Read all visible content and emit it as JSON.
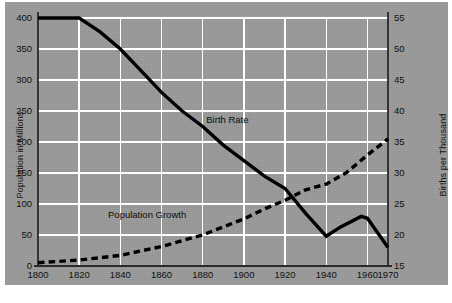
{
  "chart_data": {
    "type": "line",
    "title": "",
    "subtitle": "",
    "xlabel": "",
    "ylabel": "Population in Millions",
    "y2label": "Births per Thousand",
    "xlim": [
      1800,
      1970
    ],
    "ylim": [
      0,
      400
    ],
    "y2lim": [
      15,
      55
    ],
    "grid": true,
    "legend_position": "inline-annotations",
    "background_color": "#9b9b9b",
    "gridline_color": "#ffffff",
    "line_color": "#000000",
    "x_ticks": [
      "1800",
      "1820",
      "1840",
      "1860",
      "1880",
      "1900",
      "1920",
      "1940",
      "1960",
      "1970"
    ],
    "y_ticks": [
      "0",
      "50",
      "100",
      "150",
      "200",
      "250",
      "300",
      "350",
      "400"
    ],
    "y2_ticks": [
      "15",
      "20",
      "25",
      "30",
      "35",
      "40",
      "45",
      "50",
      "55"
    ],
    "series": [
      {
        "name": "Birth Rate",
        "axis": "right",
        "style": "solid",
        "units": "Births per Thousand",
        "x": [
          1800,
          1820,
          1830,
          1840,
          1850,
          1860,
          1870,
          1880,
          1890,
          1900,
          1910,
          1920,
          1930,
          1940,
          1947,
          1957,
          1960,
          1970
        ],
        "values": [
          55.0,
          55.0,
          52.8,
          50.0,
          46.5,
          43.0,
          40.0,
          37.5,
          34.5,
          32.0,
          29.5,
          27.5,
          23.5,
          19.8,
          21.3,
          23.0,
          22.7,
          18.0
        ]
      },
      {
        "name": "Population Growth",
        "axis": "left",
        "style": "dashed",
        "units": "Population in Millions",
        "x": [
          1800,
          1820,
          1840,
          1860,
          1880,
          1900,
          1910,
          1920,
          1930,
          1940,
          1950,
          1960,
          1970
        ],
        "values": [
          5.3,
          9.6,
          17.1,
          31.4,
          50.2,
          76.0,
          92.0,
          106.0,
          123.0,
          132.0,
          151.0,
          179.0,
          205.0
        ]
      }
    ],
    "annotations": [
      {
        "text": "Birth Rate",
        "x": 1892,
        "y_right": 38.0
      },
      {
        "text": "Population Growth",
        "x": 1853,
        "y_left": 78.0
      }
    ]
  },
  "axes": {
    "left_title": "Population in Millions",
    "right_title": "Births per Thousand"
  }
}
